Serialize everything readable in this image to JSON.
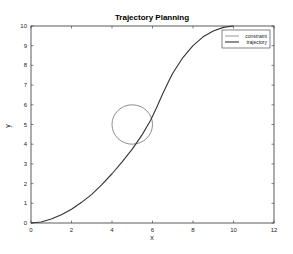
{
  "chart_data": {
    "type": "line",
    "title": "Trajectory Planning",
    "xlabel": "x",
    "ylabel": "y",
    "xlim": [
      0,
      12
    ],
    "ylim": [
      0,
      10
    ],
    "xticks": [
      0,
      2,
      4,
      6,
      8,
      10,
      12
    ],
    "yticks": [
      0,
      1,
      2,
      3,
      4,
      5,
      6,
      7,
      8,
      9,
      10
    ],
    "grid": false,
    "legend_position": "upper right",
    "series": [
      {
        "name": "constraint",
        "kind": "circle",
        "center": [
          5,
          5
        ],
        "radius": 1,
        "color": "#808080"
      },
      {
        "name": "trajectory",
        "color": "#333333",
        "x": [
          0,
          0.5,
          1,
          1.5,
          2,
          2.5,
          3,
          3.5,
          4,
          4.5,
          5,
          5.5,
          5.9,
          6.2,
          6.5,
          6.8,
          7,
          7.5,
          8,
          8.5,
          9,
          9.5,
          10
        ],
        "y": [
          0,
          0.05,
          0.2,
          0.42,
          0.7,
          1.05,
          1.45,
          1.95,
          2.5,
          3.1,
          3.75,
          4.5,
          5.2,
          5.85,
          6.55,
          7.2,
          7.6,
          8.4,
          9.0,
          9.45,
          9.75,
          9.93,
          10
        ]
      }
    ]
  }
}
